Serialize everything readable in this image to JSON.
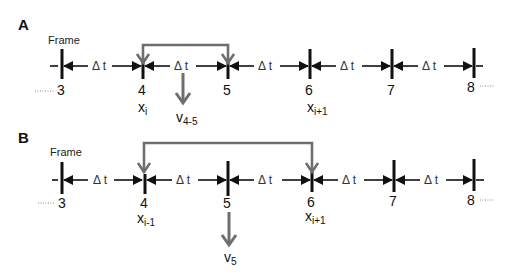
{
  "panels": [
    {
      "id": "A",
      "label": "A",
      "frame_label": "Frame",
      "frames": [
        "3",
        "4",
        "5",
        "6",
        "7",
        "8"
      ],
      "interval_label": "Δ t",
      "positions": [
        {
          "frame": "4",
          "var": "x",
          "sub": "i"
        },
        {
          "frame": "6",
          "var": "x",
          "sub": "i+1"
        }
      ],
      "bracket": {
        "from_frame": "4",
        "to_frame": "5"
      },
      "velocity": {
        "var": "v",
        "sub": "4-5"
      }
    },
    {
      "id": "B",
      "label": "B",
      "frame_label": "Frame",
      "frames": [
        "3",
        "4",
        "5",
        "6",
        "7",
        "8"
      ],
      "interval_label": "Δ t",
      "positions": [
        {
          "frame": "4",
          "var": "x",
          "sub": "i-1"
        },
        {
          "frame": "6",
          "var": "x",
          "sub": "i+1"
        }
      ],
      "bracket": {
        "from_frame": "4",
        "to_frame": "6"
      },
      "velocity": {
        "var": "v",
        "sub": "5"
      }
    }
  ],
  "colors": {
    "timeline": "#111111",
    "bracket": "#6e6e6e",
    "dotted": "#888888"
  }
}
